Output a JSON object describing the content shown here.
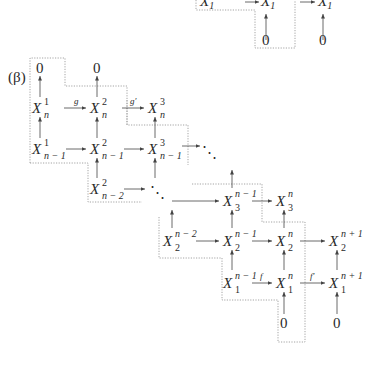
{
  "figure": {
    "label": "(β)",
    "top_fragment": {
      "nodes": [
        {
          "id": "t1",
          "main": "X",
          "sup": "",
          "sub": "1",
          "x": 203,
          "y": 4
        },
        {
          "id": "t2",
          "main": "X",
          "sup": "",
          "sub": "1",
          "x": 262,
          "y": 4
        },
        {
          "id": "t3",
          "main": "X",
          "sup": "",
          "sub": "1",
          "x": 318,
          "y": 4
        },
        {
          "id": "t4",
          "main": "0",
          "sup": "",
          "sub": "",
          "x": 264,
          "y": 44
        },
        {
          "id": "t5",
          "main": "0",
          "sup": "",
          "sub": "",
          "x": 321,
          "y": 44
        }
      ]
    },
    "nodes": [
      {
        "id": "c1z",
        "main": "0",
        "sup": "",
        "sub": "",
        "x": 36,
        "y": 72
      },
      {
        "id": "c2z",
        "main": "0",
        "sup": "",
        "sub": "",
        "x": 93,
        "y": 72
      },
      {
        "id": "x1n",
        "main": "X",
        "sup": "1",
        "sub": "n",
        "x": 32,
        "y": 112
      },
      {
        "id": "x2n",
        "main": "X",
        "sup": "2",
        "sub": "n",
        "x": 90,
        "y": 112
      },
      {
        "id": "x3n",
        "main": "X",
        "sup": "3",
        "sub": "n",
        "x": 148,
        "y": 112
      },
      {
        "id": "x1n1",
        "main": "X",
        "sup": "1",
        "sub": "n − 1",
        "x": 32,
        "y": 153
      },
      {
        "id": "x2n1",
        "main": "X",
        "sup": "2",
        "sub": "n − 1",
        "x": 90,
        "y": 153
      },
      {
        "id": "x3n1",
        "main": "X",
        "sup": "3",
        "sub": "n − 1",
        "x": 148,
        "y": 153
      },
      {
        "id": "x2n2",
        "main": "X",
        "sup": "2",
        "sub": "n − 2",
        "x": 90,
        "y": 193
      },
      {
        "id": "x3_n1",
        "main": "X",
        "sup": "n − 1",
        "sub": "3",
        "x": 223,
        "y": 205
      },
      {
        "id": "x3_n",
        "main": "X",
        "sup": "n",
        "sub": "3",
        "x": 276,
        "y": 205
      },
      {
        "id": "x2_n2",
        "main": "X",
        "sup": "n − 2",
        "sub": "2",
        "x": 166,
        "y": 245
      },
      {
        "id": "x2_n1",
        "main": "X",
        "sup": "n − 1",
        "sub": "2",
        "x": 223,
        "y": 245
      },
      {
        "id": "x2_n",
        "main": "X",
        "sup": "n",
        "sub": "2",
        "x": 276,
        "y": 245
      },
      {
        "id": "x2_np1",
        "main": "X",
        "sup": "n + 1",
        "sub": "2",
        "x": 329,
        "y": 245
      },
      {
        "id": "x1_n1",
        "main": "X",
        "sup": "n − 1",
        "sub": "1",
        "x": 223,
        "y": 287
      },
      {
        "id": "x1_n",
        "main": "X",
        "sup": "n",
        "sub": "1",
        "x": 276,
        "y": 287
      },
      {
        "id": "x1_np1",
        "main": "X",
        "sup": "n + 1",
        "sub": "1",
        "x": 329,
        "y": 287
      },
      {
        "id": "b1z",
        "main": "0",
        "sup": "",
        "sub": "",
        "x": 280,
        "y": 327
      },
      {
        "id": "b2z",
        "main": "0",
        "sup": "",
        "sub": "",
        "x": 333,
        "y": 327
      }
    ],
    "dots": [
      {
        "id": "dots1",
        "glyph": "⋱",
        "x": 186,
        "y": 154
      },
      {
        "id": "dots2",
        "glyph": "⋱",
        "x": 152,
        "y": 196
      }
    ],
    "map_labels": [
      {
        "id": "g",
        "text": "g",
        "x": 116,
        "y": 103
      },
      {
        "id": "gprime",
        "text": "g′",
        "x": 172,
        "y": 103
      },
      {
        "id": "f",
        "text": "f",
        "x": 259,
        "y": 279
      },
      {
        "id": "fprime",
        "text": "f′",
        "x": 310,
        "y": 279
      }
    ]
  }
}
